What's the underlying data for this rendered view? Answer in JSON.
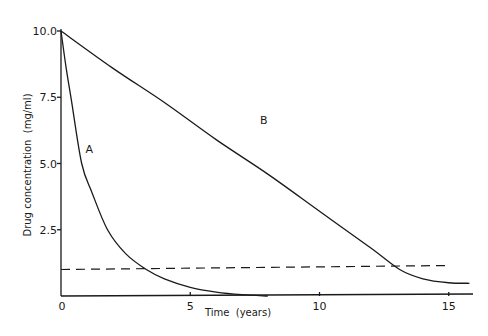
{
  "chart_data": {
    "type": "line",
    "title": "",
    "xlabel": "Time (years)",
    "ylabel": "Drug concentration (mg/ml)",
    "xlim": [
      0,
      16
    ],
    "ylim": [
      0,
      10
    ],
    "x_ticks": [
      0,
      5,
      10,
      15
    ],
    "x_tick_labels": [
      "0",
      "5",
      "10",
      "15"
    ],
    "y_ticks": [
      2.5,
      5.0,
      7.5,
      10.0
    ],
    "y_tick_labels": [
      "2.5",
      "5.0",
      "7.5",
      "10.0"
    ],
    "grid": false,
    "legend": "none (series labeled inline)",
    "series": [
      {
        "name": "A",
        "style": "solid",
        "description": "Exponential decay",
        "x": [
          0,
          0.2,
          0.4,
          0.8,
          1.2,
          1.8,
          2.5,
          3.3,
          4.0,
          5.0,
          6.0,
          7.0,
          8.0
        ],
        "values": [
          10.0,
          8.6,
          7.4,
          5.0,
          3.9,
          2.5,
          1.6,
          1.0,
          0.65,
          0.33,
          0.15,
          0.05,
          0.0
        ]
      },
      {
        "name": "B",
        "style": "solid",
        "description": "Linear (zero-order) decline, tapering",
        "x": [
          0,
          2,
          4,
          6,
          8,
          10,
          12,
          13.1,
          14,
          15,
          15.8
        ],
        "values": [
          10.0,
          8.6,
          7.3,
          5.9,
          4.6,
          3.2,
          1.8,
          1.0,
          0.65,
          0.5,
          0.48
        ]
      },
      {
        "name": "threshold",
        "style": "dashed",
        "description": "Horizontal reference level",
        "x": [
          0,
          15
        ],
        "values": [
          1.0,
          1.15
        ]
      }
    ],
    "annotations": [
      {
        "text": "A",
        "x": 0.95,
        "y": 5.4
      },
      {
        "text": "B",
        "x": 7.7,
        "y": 6.5
      }
    ]
  },
  "axes": {
    "x_title": "Time  (years)",
    "y_title": "Drug concentration  (mg/ml)"
  }
}
